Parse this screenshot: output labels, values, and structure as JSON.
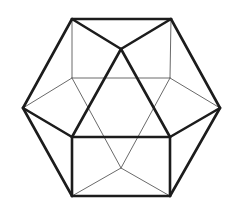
{
  "figure": {
    "stroke_colors": {
      "visible_edges": "#1c1c1c",
      "hidden_edges": "#6a6a6a"
    },
    "vertices": {
      "top_left": [
        72,
        19
      ],
      "top_right": [
        171,
        19
      ],
      "top_center": [
        121,
        49
      ],
      "left": [
        23,
        108
      ],
      "right": [
        220,
        108
      ],
      "inner_upper_left": [
        72,
        78
      ],
      "inner_upper_right": [
        170,
        78
      ],
      "front_lower_left": [
        72,
        137
      ],
      "front_lower_right": [
        170,
        137
      ],
      "bottom_left": [
        72,
        196
      ],
      "bottom_right": [
        170,
        196
      ],
      "inner_bottom_center": [
        121,
        168
      ]
    },
    "visible_edges": [
      [
        "top_left",
        "top_right"
      ],
      [
        "top_left",
        "top_center"
      ],
      [
        "top_right",
        "top_center"
      ],
      [
        "top_left",
        "left"
      ],
      [
        "top_right",
        "right"
      ],
      [
        "top_center",
        "front_lower_left"
      ],
      [
        "top_center",
        "front_lower_right"
      ],
      [
        "left",
        "front_lower_left"
      ],
      [
        "right",
        "front_lower_right"
      ],
      [
        "front_lower_left",
        "front_lower_right"
      ],
      [
        "front_lower_left",
        "bottom_left"
      ],
      [
        "front_lower_right",
        "bottom_right"
      ],
      [
        "left",
        "bottom_left"
      ],
      [
        "right",
        "bottom_right"
      ],
      [
        "bottom_left",
        "bottom_right"
      ]
    ],
    "hidden_edges": [
      [
        "top_left",
        "inner_upper_left"
      ],
      [
        "top_right",
        "inner_upper_right"
      ],
      [
        "inner_upper_left",
        "inner_upper_right"
      ],
      [
        "left",
        "inner_upper_left"
      ],
      [
        "right",
        "inner_upper_right"
      ],
      [
        "inner_upper_left",
        "inner_bottom_center"
      ],
      [
        "inner_upper_right",
        "inner_bottom_center"
      ],
      [
        "bottom_left",
        "inner_bottom_center"
      ],
      [
        "bottom_right",
        "inner_bottom_center"
      ]
    ]
  }
}
